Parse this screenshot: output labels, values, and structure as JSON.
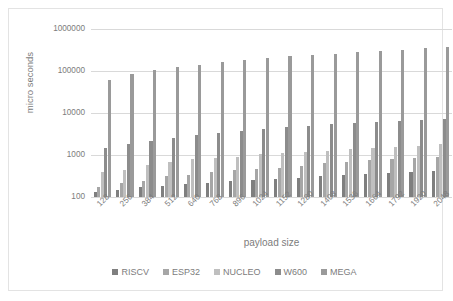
{
  "chart_data": {
    "type": "bar",
    "title": "",
    "xlabel": "payload size",
    "ylabel": "micro seconds",
    "yscale": "log",
    "ylim": [
      100,
      1000000
    ],
    "yticks": [
      "100",
      "1000",
      "10000",
      "100000",
      "1000000"
    ],
    "grid": true,
    "legend_position": "bottom",
    "categories": [
      "128",
      "256",
      "384",
      "512",
      "640",
      "768",
      "896",
      "1024",
      "1152",
      "1280",
      "1408",
      "1536",
      "1664",
      "1792",
      "1920",
      "2048"
    ],
    "series": [
      {
        "name": "RISCV",
        "color": "#7f7f7f",
        "values": [
          130,
          150,
          170,
          185,
          200,
          215,
          235,
          250,
          265,
          290,
          320,
          340,
          355,
          375,
          400,
          415
        ]
      },
      {
        "name": "ESP32",
        "color": "#a6a6a6",
        "values": [
          175,
          215,
          245,
          310,
          330,
          395,
          430,
          460,
          500,
          560,
          640,
          700,
          755,
          800,
          845,
          900
        ]
      },
      {
        "name": "NUCLEO",
        "color": "#bfbfbf",
        "values": [
          390,
          450,
          570,
          700,
          790,
          840,
          920,
          1030,
          1120,
          1200,
          1250,
          1370,
          1460,
          1560,
          1680,
          1790
        ]
      },
      {
        "name": "W600",
        "color": "#8c8c8c",
        "values": [
          1470,
          1830,
          2200,
          2540,
          2950,
          3350,
          3800,
          4100,
          4600,
          5000,
          5350,
          5700,
          6100,
          6500,
          6900,
          7300
        ]
      },
      {
        "name": "MEGA",
        "color": "#9a9a9a",
        "values": [
          62000,
          85000,
          105000,
          122000,
          142000,
          168000,
          188000,
          208000,
          225000,
          243000,
          260000,
          280000,
          300000,
          325000,
          350000,
          372000
        ]
      }
    ]
  },
  "legend": {
    "items": [
      {
        "label": "RISCV"
      },
      {
        "label": "ESP32"
      },
      {
        "label": "NUCLEO"
      },
      {
        "label": "W600"
      },
      {
        "label": "MEGA"
      }
    ]
  }
}
